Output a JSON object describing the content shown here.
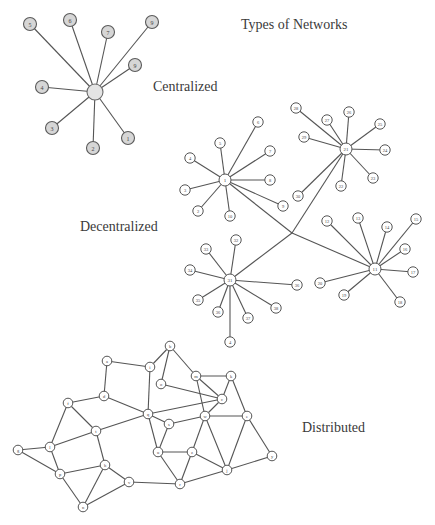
{
  "title": "Types of Networks",
  "sections": {
    "centralized": {
      "label": "Centralized",
      "hub": {
        "x": 95,
        "y": 92,
        "r": 8,
        "label": ""
      },
      "nodes": [
        {
          "label": "5",
          "x": 30,
          "y": 24
        },
        {
          "label": "6",
          "x": 70,
          "y": 20
        },
        {
          "label": "7",
          "x": 108,
          "y": 32
        },
        {
          "label": "9",
          "x": 152,
          "y": 22
        },
        {
          "label": "9",
          "x": 135,
          "y": 65
        },
        {
          "label": "4",
          "x": 42,
          "y": 87
        },
        {
          "label": "3",
          "x": 52,
          "y": 128
        },
        {
          "label": "2",
          "x": 93,
          "y": 148
        },
        {
          "label": "1",
          "x": 128,
          "y": 138
        }
      ]
    },
    "decentralized": {
      "label": "Decentralized",
      "junction": {
        "x": 292,
        "y": 233
      },
      "hubs": [
        {
          "label": "1",
          "x": 225,
          "y": 180,
          "nodes": [
            {
              "label": "6",
              "x": 258,
              "y": 122
            },
            {
              "label": "5",
              "x": 220,
              "y": 143
            },
            {
              "label": "4",
              "x": 190,
              "y": 158
            },
            {
              "label": "7",
              "x": 270,
              "y": 151
            },
            {
              "label": "8",
              "x": 270,
              "y": 180
            },
            {
              "label": "3",
              "x": 185,
              "y": 190
            },
            {
              "label": "2",
              "x": 198,
              "y": 211
            },
            {
              "label": "10",
              "x": 230,
              "y": 216
            },
            {
              "label": "9",
              "x": 283,
              "y": 206
            }
          ]
        },
        {
          "label": "21",
          "x": 346,
          "y": 149,
          "nodes": [
            {
              "label": "28",
              "x": 296,
              "y": 108
            },
            {
              "label": "27",
              "x": 327,
              "y": 120
            },
            {
              "label": "26",
              "x": 349,
              "y": 112
            },
            {
              "label": "25",
              "x": 380,
              "y": 124
            },
            {
              "label": "29",
              "x": 304,
              "y": 137
            },
            {
              "label": "24",
              "x": 385,
              "y": 150
            },
            {
              "label": "23",
              "x": 373,
              "y": 178
            },
            {
              "label": "22",
              "x": 341,
              "y": 186
            },
            {
              "label": "30",
              "x": 298,
              "y": 196
            }
          ]
        },
        {
          "label": "11",
          "x": 375,
          "y": 269,
          "nodes": [
            {
              "label": "12",
              "x": 327,
              "y": 221
            },
            {
              "label": "13",
              "x": 358,
              "y": 218
            },
            {
              "label": "14",
              "x": 387,
              "y": 227
            },
            {
              "label": "15",
              "x": 416,
              "y": 219
            },
            {
              "label": "16",
              "x": 405,
              "y": 249
            },
            {
              "label": "17",
              "x": 413,
              "y": 272
            },
            {
              "label": "18",
              "x": 400,
              "y": 302
            },
            {
              "label": "19",
              "x": 344,
              "y": 295
            },
            {
              "label": "20",
              "x": 320,
              "y": 283
            }
          ]
        },
        {
          "label": "31",
          "x": 230,
          "y": 280,
          "nodes": [
            {
              "label": "32",
              "x": 236,
              "y": 240
            },
            {
              "label": "33",
              "x": 206,
              "y": 249
            },
            {
              "label": "34",
              "x": 190,
              "y": 270
            },
            {
              "label": "35",
              "x": 198,
              "y": 300
            },
            {
              "label": "36",
              "x": 218,
              "y": 312
            },
            {
              "label": "37",
              "x": 248,
              "y": 318
            },
            {
              "label": "38",
              "x": 276,
              "y": 308
            },
            {
              "label": "36",
              "x": 297,
              "y": 285
            },
            {
              "label": "4",
              "x": 230,
              "y": 342
            }
          ]
        }
      ]
    },
    "distributed": {
      "label": "Distributed",
      "nodes": [
        {
          "id": "a",
          "x": 107,
          "y": 361
        },
        {
          "id": "i",
          "x": 150,
          "y": 367
        },
        {
          "id": "b",
          "x": 170,
          "y": 346
        },
        {
          "id": "o",
          "x": 161,
          "y": 384
        },
        {
          "id": "m",
          "x": 196,
          "y": 376
        },
        {
          "id": "k",
          "x": 231,
          "y": 376
        },
        {
          "id": "c",
          "x": 222,
          "y": 399
        },
        {
          "id": "f",
          "x": 68,
          "y": 403
        },
        {
          "id": "d",
          "x": 104,
          "y": 396
        },
        {
          "id": "q",
          "x": 148,
          "y": 414
        },
        {
          "id": "s",
          "x": 169,
          "y": 424
        },
        {
          "id": "w",
          "x": 205,
          "y": 416
        },
        {
          "id": "e",
          "x": 247,
          "y": 416
        },
        {
          "id": "t",
          "x": 96,
          "y": 431
        },
        {
          "id": "g",
          "x": 18,
          "y": 450
        },
        {
          "id": "l",
          "x": 50,
          "y": 447
        },
        {
          "id": "h",
          "x": 105,
          "y": 465
        },
        {
          "id": "u",
          "x": 158,
          "y": 452
        },
        {
          "id": "z",
          "x": 192,
          "y": 452
        },
        {
          "id": "j",
          "x": 227,
          "y": 470
        },
        {
          "id": "y",
          "x": 272,
          "y": 456
        },
        {
          "id": "p",
          "x": 60,
          "y": 474
        },
        {
          "id": "v",
          "x": 129,
          "y": 482
        },
        {
          "id": "n",
          "x": 83,
          "y": 507
        },
        {
          "id": "r",
          "x": 180,
          "y": 484
        }
      ],
      "edges": [
        [
          "a",
          "i"
        ],
        [
          "a",
          "d"
        ],
        [
          "i",
          "b"
        ],
        [
          "i",
          "q"
        ],
        [
          "b",
          "o"
        ],
        [
          "b",
          "m"
        ],
        [
          "o",
          "c"
        ],
        [
          "m",
          "k"
        ],
        [
          "m",
          "c"
        ],
        [
          "m",
          "w"
        ],
        [
          "k",
          "c"
        ],
        [
          "k",
          "e"
        ],
        [
          "c",
          "w"
        ],
        [
          "c",
          "q"
        ],
        [
          "d",
          "q"
        ],
        [
          "d",
          "f"
        ],
        [
          "f",
          "t"
        ],
        [
          "f",
          "l"
        ],
        [
          "q",
          "s"
        ],
        [
          "q",
          "t"
        ],
        [
          "s",
          "w"
        ],
        [
          "s",
          "u"
        ],
        [
          "w",
          "e"
        ],
        [
          "w",
          "z"
        ],
        [
          "w",
          "j"
        ],
        [
          "e",
          "j"
        ],
        [
          "e",
          "y"
        ],
        [
          "t",
          "l"
        ],
        [
          "t",
          "h"
        ],
        [
          "l",
          "g"
        ],
        [
          "l",
          "p"
        ],
        [
          "g",
          "p"
        ],
        [
          "p",
          "h"
        ],
        [
          "p",
          "n"
        ],
        [
          "h",
          "n"
        ],
        [
          "h",
          "v"
        ],
        [
          "u",
          "z"
        ],
        [
          "u",
          "r"
        ],
        [
          "z",
          "r"
        ],
        [
          "z",
          "j"
        ],
        [
          "j",
          "y"
        ],
        [
          "j",
          "r"
        ],
        [
          "v",
          "r"
        ],
        [
          "n",
          "v"
        ],
        [
          "q",
          "u"
        ]
      ]
    }
  },
  "label_positions": {
    "title": {
      "x": 241,
      "y": 17
    },
    "centralized": {
      "x": 153,
      "y": 79
    },
    "decentralized": {
      "x": 80,
      "y": 219
    },
    "distributed": {
      "x": 302,
      "y": 420
    }
  },
  "colors": {
    "edge": "#555555",
    "central_node_fill": "#d6d6d6",
    "node_fill": "#ffffff",
    "text": "#3a3a3a"
  }
}
